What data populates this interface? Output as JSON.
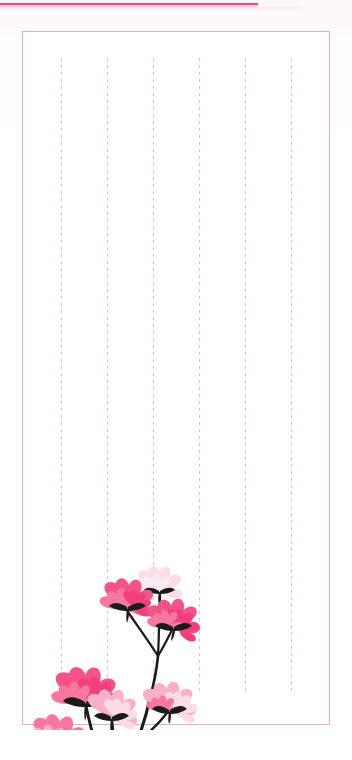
{
  "page": {
    "kind": "stationery-letter-paper",
    "width": 352,
    "height": 760,
    "background_color": "#fdfbfc",
    "paper_color": "#ffffff"
  },
  "top_rule": {
    "name": "top-accent-rule",
    "color": "#f2477f",
    "soft_color": "#fbc3d6",
    "left": 0,
    "top": 3,
    "width": 258,
    "height": 2
  },
  "frame": {
    "name": "page-border-frame",
    "border_color": "#eeaac4",
    "border_width": 1,
    "left": 22,
    "top": 31,
    "width": 308,
    "height": 694
  },
  "rule_lines": {
    "name": "dashed-ruling-lines",
    "count": 6,
    "color": "#f0b9cd",
    "dash": 3,
    "gap": 4,
    "top": 58,
    "height": 636,
    "x_positions": [
      61,
      107,
      153,
      199,
      245,
      291
    ]
  },
  "flower_art": {
    "name": "cosmos-flower-illustration",
    "left": 24,
    "top": 540,
    "width": 190,
    "height": 190,
    "stem_color": "#1b1b1b",
    "palette": {
      "vivid_pink": "#f4538a",
      "mid_pink": "#f9779e",
      "light_pink": "#fbafc8",
      "pale_pink": "#fcdce6",
      "deep_pink": "#ef3f7c"
    },
    "blooms": [
      {
        "id": "bloom-top-pale",
        "cx": 136,
        "cy": 46,
        "r": 17,
        "color": "#fcdce6"
      },
      {
        "id": "bloom-upper-left",
        "cx": 103,
        "cy": 63,
        "r": 19,
        "color": "#f4538a"
      },
      {
        "id": "bloom-upper-right",
        "cx": 148,
        "cy": 82,
        "r": 19,
        "color": "#f4538a"
      },
      {
        "id": "bloom-mid-left-large",
        "cx": 61,
        "cy": 155,
        "r": 23,
        "color": "#f4538a"
      },
      {
        "id": "bloom-mid-center-pale",
        "cx": 88,
        "cy": 172,
        "r": 18,
        "color": "#fbafc8"
      },
      {
        "id": "bloom-mid-right-light",
        "cx": 143,
        "cy": 165,
        "r": 18,
        "color": "#fbafc8"
      },
      {
        "id": "bloom-lower-left",
        "cx": 33,
        "cy": 200,
        "r": 19,
        "color": "#f9779e"
      },
      {
        "id": "bloom-bottom-left",
        "cx": 53,
        "cy": 240,
        "r": 18,
        "color": "#f4538a"
      }
    ],
    "stem_node": {
      "id": "stem-convergence-node",
      "x": 88,
      "y": 249
    }
  }
}
